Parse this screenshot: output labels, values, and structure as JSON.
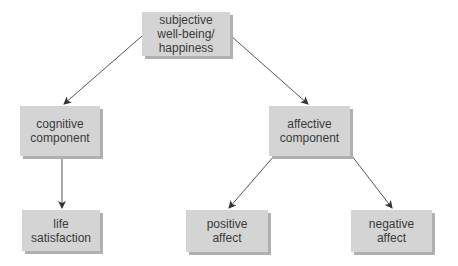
{
  "diagram": {
    "type": "hierarchy",
    "nodes": [
      {
        "id": "swb",
        "label_lines": [
          "subjective",
          "well-being/",
          "happiness"
        ]
      },
      {
        "id": "cognitive",
        "label_lines": [
          "cognitive",
          "component"
        ]
      },
      {
        "id": "affective",
        "label_lines": [
          "affective",
          "component"
        ]
      },
      {
        "id": "life",
        "label_lines": [
          "life",
          "satisfaction"
        ]
      },
      {
        "id": "positive",
        "label_lines": [
          "positive",
          "affect"
        ]
      },
      {
        "id": "negative",
        "label_lines": [
          "negative",
          "affect"
        ]
      }
    ],
    "edges": [
      {
        "from": "swb",
        "to": "cognitive"
      },
      {
        "from": "swb",
        "to": "affective"
      },
      {
        "from": "cognitive",
        "to": "life"
      },
      {
        "from": "affective",
        "to": "positive"
      },
      {
        "from": "affective",
        "to": "negative"
      }
    ],
    "colors": {
      "node_fill": "#d4d4d4",
      "node_shadow": "#b0b0b0",
      "text": "#3a3a3a",
      "edge": "#444444"
    }
  }
}
